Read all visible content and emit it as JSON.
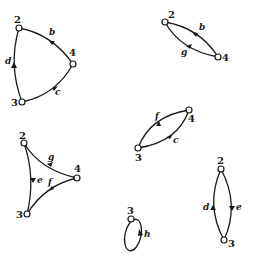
{
  "diagram": {
    "type": "directed multigraph components",
    "colors": {
      "ink": "#1a1a1a",
      "background": "#ffffff"
    },
    "graphs": [
      {
        "id": "triangle-bcd",
        "nodes": [
          {
            "label": "2",
            "x": 19,
            "y": 28
          },
          {
            "label": "4",
            "x": 73,
            "y": 64
          },
          {
            "label": "3",
            "x": 22,
            "y": 102
          }
        ],
        "edges": [
          {
            "label": "b",
            "from": "2",
            "to": "4"
          },
          {
            "label": "c",
            "from": "4",
            "to": "3"
          },
          {
            "label": "d",
            "from": "3",
            "to": "2"
          }
        ]
      },
      {
        "id": "pair-bg",
        "nodes": [
          {
            "label": "2",
            "x": 165,
            "y": 22
          },
          {
            "label": "4",
            "x": 218,
            "y": 57
          }
        ],
        "edges": [
          {
            "label": "b",
            "from": "2",
            "to": "4"
          },
          {
            "label": "g",
            "from": "4",
            "to": "2"
          }
        ]
      },
      {
        "id": "pair-fc",
        "nodes": [
          {
            "label": "4",
            "x": 189,
            "y": 110
          },
          {
            "label": "3",
            "x": 138,
            "y": 148
          }
        ],
        "edges": [
          {
            "label": "f",
            "from": "3",
            "to": "4"
          },
          {
            "label": "c",
            "from": "4",
            "to": "3"
          }
        ]
      },
      {
        "id": "triangle-gef",
        "nodes": [
          {
            "label": "2",
            "x": 24,
            "y": 143
          },
          {
            "label": "4",
            "x": 77,
            "y": 178
          },
          {
            "label": "3",
            "x": 27,
            "y": 214
          }
        ],
        "edges": [
          {
            "label": "g",
            "from": "4",
            "to": "2"
          },
          {
            "label": "e",
            "from": "2",
            "to": "3"
          },
          {
            "label": "f",
            "from": "3",
            "to": "4"
          }
        ]
      },
      {
        "id": "loop-h",
        "nodes": [
          {
            "label": "3",
            "x": 131,
            "y": 219
          }
        ],
        "edges": [
          {
            "label": "h",
            "from": "3",
            "to": "3"
          }
        ]
      },
      {
        "id": "pair-de",
        "nodes": [
          {
            "label": "2",
            "x": 221,
            "y": 169
          },
          {
            "label": "3",
            "x": 224,
            "y": 240
          }
        ],
        "edges": [
          {
            "label": "d",
            "from": "3",
            "to": "2"
          },
          {
            "label": "e",
            "from": "2",
            "to": "3"
          }
        ]
      }
    ]
  }
}
